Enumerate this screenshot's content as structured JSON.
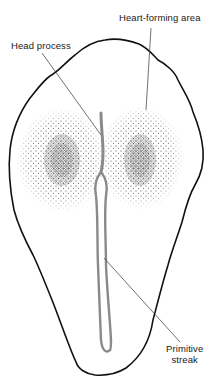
{
  "diagram": {
    "type": "biological-illustration",
    "labels": {
      "heart_forming_area": "Heart-forming area",
      "head_process": "Head process",
      "primitive_streak_line1": "Primitive",
      "primitive_streak_line2": "streak"
    },
    "colors": {
      "outline": "#111111",
      "stipple": "#222222",
      "streak": "#8a8a8a",
      "leader_line": "#333333",
      "background": "#ffffff"
    },
    "regions": [
      {
        "name": "left heart-forming area",
        "center": [
          62,
          160
        ]
      },
      {
        "name": "right heart-forming area",
        "center": [
          140,
          160
        ]
      },
      {
        "name": "head process",
        "top": [
          101,
          113
        ]
      },
      {
        "name": "primitive streak",
        "bottom": [
          108,
          352
        ]
      }
    ]
  }
}
